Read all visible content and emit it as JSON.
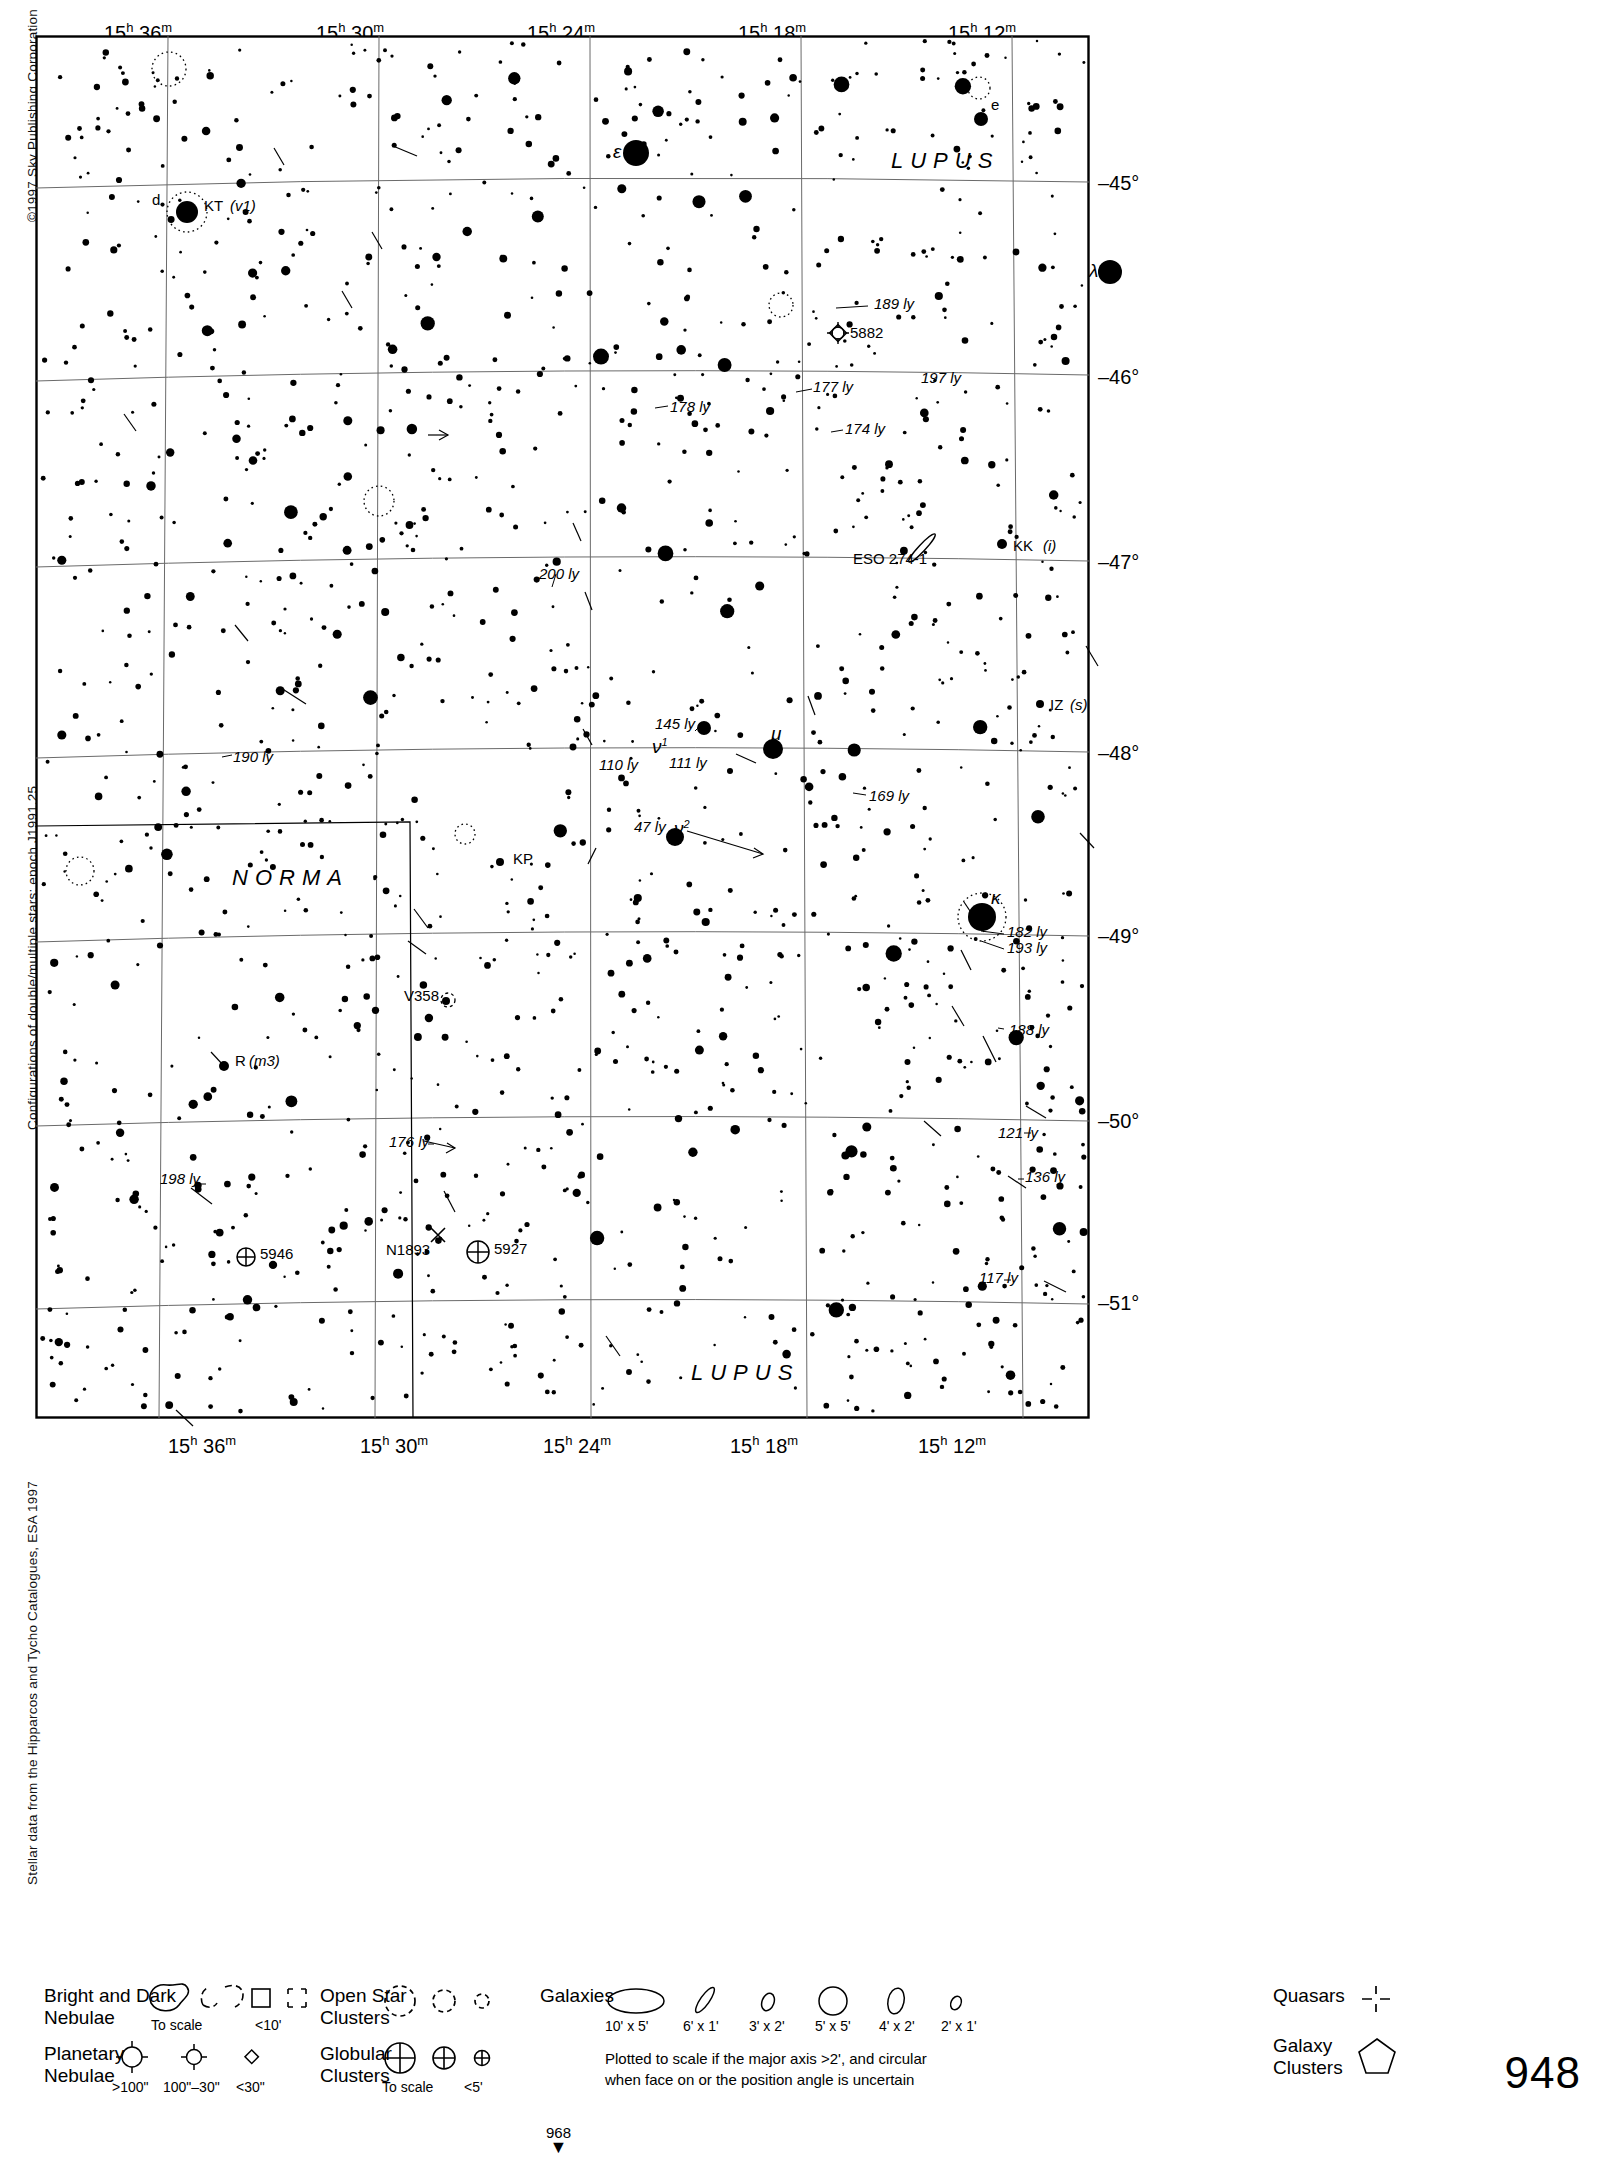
{
  "margins": {
    "copyright": "©1997 Sky Publishing Corporation",
    "note_configurations": "Configurations of double/multiple stars: epoch J1991.25",
    "note_source": "Stellar data from the Hipparcos and Tycho Catalogues, ESA 1997"
  },
  "page": {
    "chart_number": "948",
    "continuation_ref": "968"
  },
  "axes": {
    "ra_top": [
      "15h 36m",
      "15h 30m",
      "15h 24m",
      "15h 18m",
      "15h 12m"
    ],
    "ra_bottom": [
      "15h 36m",
      "15h 30m",
      "15h 24m",
      "15h 18m",
      "15h 12m"
    ],
    "dec_right": [
      "–45°",
      "–46°",
      "–47°",
      "–48°",
      "–49°",
      "–50°",
      "–51°"
    ]
  },
  "constellations": [
    {
      "name": "LUPUS",
      "x": 855,
      "y": 128
    },
    {
      "name": "NORMA",
      "x": 196,
      "y": 845
    },
    {
      "name": "LUPUS",
      "x": 655,
      "y": 1340
    }
  ],
  "labels": [
    {
      "text": "d",
      "x": 116,
      "y": 166,
      "style": "plain"
    },
    {
      "text": "KT",
      "x": 168,
      "y": 172,
      "style": "plain"
    },
    {
      "text": "(v1)",
      "x": 194,
      "y": 172,
      "style": "ital"
    },
    {
      "text": "e",
      "x": 955,
      "y": 71,
      "style": "plain"
    },
    {
      "text": "ε",
      "x": 577,
      "y": 116,
      "style": "grk"
    },
    {
      "text": "λ",
      "x": 1053,
      "y": 235,
      "style": "grk"
    },
    {
      "text": "189 ly",
      "x": 838,
      "y": 270,
      "style": "ital"
    },
    {
      "text": "5882",
      "x": 814,
      "y": 299,
      "style": "plain"
    },
    {
      "text": "197 ly",
      "x": 885,
      "y": 344,
      "style": "ital"
    },
    {
      "text": "177 ly",
      "x": 777,
      "y": 353,
      "style": "ital"
    },
    {
      "text": "178 ly",
      "x": 634,
      "y": 373,
      "style": "ital"
    },
    {
      "text": "174 ly",
      "x": 809,
      "y": 395,
      "style": "ital"
    },
    {
      "text": "KK",
      "x": 977,
      "y": 512,
      "style": "plain"
    },
    {
      "text": "(i)",
      "x": 1007,
      "y": 512,
      "style": "ital"
    },
    {
      "text": "ESO 274-1",
      "x": 817,
      "y": 525,
      "style": "plain"
    },
    {
      "text": "200 ly",
      "x": 503,
      "y": 540,
      "style": "ital"
    },
    {
      "text": "IZ",
      "x": 1014,
      "y": 671,
      "style": "plain"
    },
    {
      "text": "(s)",
      "x": 1034,
      "y": 671,
      "style": "ital"
    },
    {
      "text": "145 ly",
      "x": 619,
      "y": 690,
      "style": "ital"
    },
    {
      "text": "ν",
      "x": 616,
      "y": 711,
      "style": "grksup",
      "sup": "1"
    },
    {
      "text": "μ",
      "x": 735,
      "y": 698,
      "style": "grk"
    },
    {
      "text": "190 ly",
      "x": 197,
      "y": 723,
      "style": "ital"
    },
    {
      "text": "110 ly",
      "x": 563,
      "y": 731,
      "style": "ital"
    },
    {
      "text": "111 ly",
      "x": 633,
      "y": 729,
      "style": "ital"
    },
    {
      "text": "169 ly",
      "x": 833,
      "y": 762,
      "style": "ital"
    },
    {
      "text": "47 ly",
      "x": 598,
      "y": 793,
      "style": "ital"
    },
    {
      "text": "ν",
      "x": 638,
      "y": 793,
      "style": "grksup",
      "sup": "2"
    },
    {
      "text": "KP",
      "x": 477,
      "y": 825,
      "style": "plain"
    },
    {
      "text": "κ",
      "x": 955,
      "y": 862,
      "style": "grk"
    },
    {
      "text": "182 ly",
      "x": 971,
      "y": 898,
      "style": "ital"
    },
    {
      "text": "193 ly",
      "x": 971,
      "y": 914,
      "style": "ital"
    },
    {
      "text": "V358",
      "x": 368,
      "y": 962,
      "style": "plain"
    },
    {
      "text": "188 ly",
      "x": 973,
      "y": 996,
      "style": "ital"
    },
    {
      "text": "R",
      "x": 199,
      "y": 1027,
      "style": "plain"
    },
    {
      "text": "(m3)",
      "x": 213,
      "y": 1027,
      "style": "ital"
    },
    {
      "text": "121 ly",
      "x": 962,
      "y": 1099,
      "style": "ital"
    },
    {
      "text": "176 ly",
      "x": 353,
      "y": 1108,
      "style": "ital"
    },
    {
      "text": "136 ly",
      "x": 989,
      "y": 1143,
      "style": "ital"
    },
    {
      "text": "198 ly",
      "x": 124,
      "y": 1145,
      "style": "ital"
    },
    {
      "text": "117 ly",
      "x": 943,
      "y": 1244,
      "style": "ital"
    },
    {
      "text": "5946",
      "x": 224,
      "y": 1220,
      "style": "plain"
    },
    {
      "text": "N1893",
      "x": 350,
      "y": 1216,
      "style": "plain"
    },
    {
      "text": "5927",
      "x": 458,
      "y": 1215,
      "style": "plain"
    }
  ],
  "legend": {
    "groups": [
      {
        "name": "nebulae",
        "title_l1": "Bright and Dark",
        "title_l2": "Nebulae",
        "captions": [
          "To scale",
          "<10'"
        ]
      },
      {
        "name": "planetary",
        "title_l1": "Planetary",
        "title_l2": "Nebulae",
        "captions": [
          ">100\"",
          "100\"–30\"",
          "<30\""
        ]
      },
      {
        "name": "open-clusters",
        "title_l1": "Open Star",
        "title_l2": "Clusters",
        "captions": []
      },
      {
        "name": "globular",
        "title_l1": "Globular",
        "title_l2": "Clusters",
        "captions": [
          "To scale",
          "<5'"
        ]
      },
      {
        "name": "galaxies",
        "title_l1": "Galaxies",
        "title_l2": "",
        "captions": [
          "10' x 5'",
          "6' x 1'",
          "3' x 2'",
          "5' x 5'",
          "4' x 2'",
          "2' x 1'"
        ]
      },
      {
        "name": "quasars",
        "title_l1": "Quasars",
        "title_l2": "",
        "captions": []
      },
      {
        "name": "galaxy-clusters",
        "title_l1": "Galaxy",
        "title_l2": "Clusters",
        "captions": []
      }
    ],
    "galaxy_note_l1": "Plotted to scale if the major axis >2', and circular",
    "galaxy_note_l2": "when face on or the position angle is uncertain"
  },
  "chart_data": {
    "type": "scatter",
    "xlabel": "Right Ascension",
    "ylabel": "Declination",
    "xlim": [
      "15h 38m",
      "15h 09m"
    ],
    "ylim": [
      "-44.5°",
      "-51.4°"
    ],
    "grid": true,
    "ra_gridlines": [
      "15h 36m",
      "15h 30m",
      "15h 24m",
      "15h 18m",
      "15h 12m"
    ],
    "dec_gridlines": [
      "-45°",
      "-46°",
      "-47°",
      "-48°",
      "-49°",
      "-50°",
      "-51°"
    ],
    "named_objects": [
      {
        "id": "KT",
        "type": "variable-double",
        "label": "KT (v1)",
        "x": 151,
        "y": 176,
        "mag_r": 11
      },
      {
        "id": "d",
        "type": "star",
        "label": "d",
        "x": 151,
        "y": 176
      },
      {
        "id": "e",
        "type": "star",
        "label": "e",
        "x": 945,
        "y": 83,
        "mag_r": 7
      },
      {
        "id": "eps",
        "type": "star",
        "label": "ε",
        "x": 600,
        "y": 117,
        "mag_r": 13
      },
      {
        "id": "lam",
        "type": "star",
        "label": "λ",
        "x": 1074,
        "y": 236,
        "mag_r": 12
      },
      {
        "id": "5882",
        "type": "planetary-nebula",
        "label": "5882",
        "x": 802,
        "y": 297
      },
      {
        "id": "ESO274-1",
        "type": "galaxy",
        "label": "ESO 274-1",
        "x": 886,
        "y": 512
      },
      {
        "id": "KK",
        "type": "star",
        "label": "KK (i)",
        "x": 966,
        "y": 508,
        "mag_r": 5
      },
      {
        "id": "IZ",
        "type": "star",
        "label": "IZ (s)",
        "x": 1004,
        "y": 668,
        "mag_r": 4
      },
      {
        "id": "nu1",
        "type": "star",
        "label": "ν¹",
        "x": 668,
        "y": 692,
        "mag_r": 7
      },
      {
        "id": "mu",
        "type": "star",
        "label": "μ",
        "x": 737,
        "y": 713,
        "mag_r": 10
      },
      {
        "id": "nu2",
        "type": "star",
        "label": "ν²",
        "x": 639,
        "y": 801,
        "mag_r": 9
      },
      {
        "id": "KP",
        "type": "star",
        "label": "KP",
        "x": 464,
        "y": 826,
        "mag_r": 4
      },
      {
        "id": "kappa",
        "type": "star",
        "label": "κ",
        "x": 946,
        "y": 881,
        "mag_r": 14
      },
      {
        "id": "V358",
        "type": "star",
        "label": "V358",
        "x": 410,
        "y": 965,
        "mag_r": 4
      },
      {
        "id": "R",
        "type": "star",
        "label": "R (m3)",
        "x": 188,
        "y": 1030,
        "mag_r": 5
      },
      {
        "id": "5946",
        "type": "globular-cluster",
        "label": "5946",
        "x": 212,
        "y": 1221
      },
      {
        "id": "5927",
        "type": "globular-cluster",
        "label": "5927",
        "x": 443,
        "y": 1216
      },
      {
        "id": "N1893",
        "type": "quasar",
        "label": "N1893",
        "x": 402,
        "y": 1200
      }
    ],
    "distance_labels_ly": [
      189,
      197,
      177,
      178,
      174,
      200,
      145,
      190,
      110,
      111,
      169,
      47,
      182,
      193,
      188,
      121,
      176,
      136,
      198,
      117
    ]
  }
}
